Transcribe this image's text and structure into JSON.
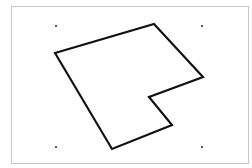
{
  "diagram": {
    "background": "#ffffff",
    "frame": {
      "x": 11,
      "y": 6,
      "width": 237,
      "height": 157,
      "stroke": "#c8c8c8",
      "stroke_width": 1
    },
    "corner_dots": [
      {
        "x": 56,
        "y": 26
      },
      {
        "x": 202,
        "y": 26
      },
      {
        "x": 56,
        "y": 147
      },
      {
        "x": 202,
        "y": 147
      }
    ],
    "dot_color": "#222222",
    "dot_radius": 1,
    "polygon": {
      "points": [
        [
          55,
          53
        ],
        [
          154,
          24
        ],
        [
          203,
          77
        ],
        [
          149,
          97
        ],
        [
          172,
          125
        ],
        [
          112,
          149
        ]
      ],
      "stroke": "#111111",
      "stroke_width": 2.2,
      "fill": "none"
    }
  }
}
